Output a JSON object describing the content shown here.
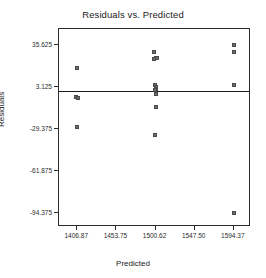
{
  "chart_data": {
    "type": "scatter",
    "title": "Residuals vs. Predicted",
    "xlabel": "Predicted",
    "ylabel": "Residuals",
    "xlim": [
      1385.0,
      1615.0
    ],
    "ylim": [
      -105.0,
      48.0
    ],
    "grid": false,
    "legend": null,
    "marker": {
      "shape": "square",
      "fill_color": "#6b6b6b",
      "edge_color": "#4a4a4a",
      "size_px": 4
    },
    "reference_line": {
      "orientation": "horizontal",
      "y": 0,
      "color": "#1a1a1a",
      "width_px": 1
    },
    "xticks": [
      {
        "value": 1406.87,
        "label": "1406.87"
      },
      {
        "value": 1453.75,
        "label": "1453.75"
      },
      {
        "value": 1500.62,
        "label": "1500.62"
      },
      {
        "value": 1547.5,
        "label": "1547.50"
      },
      {
        "value": 1594.37,
        "label": "1594.37"
      }
    ],
    "yticks": [
      {
        "value": 35.625,
        "label": "35.625"
      },
      {
        "value": 3.125,
        "label": "3.125"
      },
      {
        "value": -29.375,
        "label": "-29.375"
      },
      {
        "value": -61.875,
        "label": "-61.875"
      },
      {
        "value": -94.375,
        "label": "-94.375"
      }
    ],
    "points": [
      {
        "x": 1406.9,
        "y": 18.0
      },
      {
        "x": 1405.6,
        "y": -4.5
      },
      {
        "x": 1407.6,
        "y": -5.5
      },
      {
        "x": 1406.9,
        "y": -27.5
      },
      {
        "x": 1499.0,
        "y": 30.0
      },
      {
        "x": 1500.8,
        "y": 25.5
      },
      {
        "x": 1502.0,
        "y": 25.5
      },
      {
        "x": 1499.4,
        "y": 25.0
      },
      {
        "x": 1499.8,
        "y": 4.5
      },
      {
        "x": 1500.6,
        "y": 3.0
      },
      {
        "x": 1501.2,
        "y": 2.0
      },
      {
        "x": 1500.2,
        "y": 1.0
      },
      {
        "x": 1501.6,
        "y": -2.5
      },
      {
        "x": 1501.6,
        "y": -12.5
      },
      {
        "x": 1499.8,
        "y": -34.0
      },
      {
        "x": 1594.4,
        "y": 36.0
      },
      {
        "x": 1594.4,
        "y": 30.5
      },
      {
        "x": 1594.4,
        "y": 5.0
      },
      {
        "x": 1594.4,
        "y": -94.4
      }
    ]
  }
}
